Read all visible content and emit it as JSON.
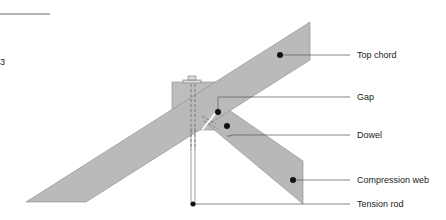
{
  "diagram": {
    "colors": {
      "member_fill": "#b8b8b8",
      "member_stroke": "#8a8a8a",
      "leader": "#555555",
      "dot": "#111111"
    },
    "labels": [
      {
        "id": "top-chord",
        "text": "Top chord"
      },
      {
        "id": "gap",
        "text": "Gap"
      },
      {
        "id": "dowel",
        "text": "Dowel"
      },
      {
        "id": "compression-web",
        "text": "Compression web"
      },
      {
        "id": "tension-rod",
        "text": "Tension rod"
      }
    ],
    "margin_text": "3"
  }
}
